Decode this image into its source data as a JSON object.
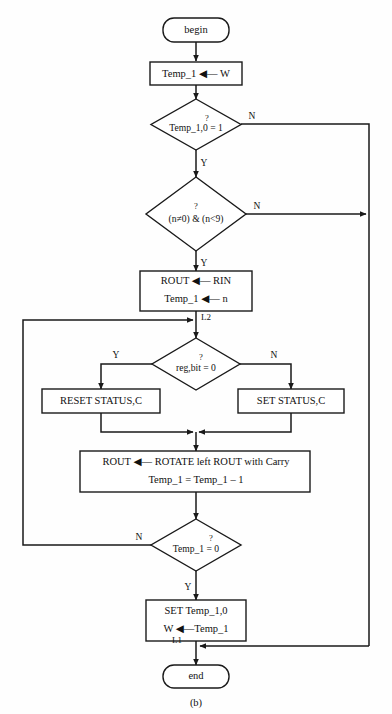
{
  "figure": {
    "caption": "(b)",
    "type": "flowchart",
    "stroke_color": "#1a1a1a",
    "fill_color": "#ffffff",
    "text_color": "#111111"
  },
  "nodes": {
    "begin": {
      "label": "begin",
      "shape": "terminator"
    },
    "load_temp": {
      "line1": "Temp_1 ◀— W",
      "shape": "process"
    },
    "decide_bit0": {
      "question_mark": "?",
      "label": "Temp_1,0 = 1",
      "shape": "decision"
    },
    "decide_range": {
      "question_mark": "?",
      "label": "(n≠0) & (n<9)",
      "shape": "decision"
    },
    "init_rout": {
      "line1": "ROUT ◀— RIN",
      "line2": "Temp_1 ◀— n",
      "shape": "process"
    },
    "decide_regbit": {
      "question_mark": "?",
      "label": "reg,bit = 0",
      "shape": "decision"
    },
    "reset_status": {
      "label": "RESET  STATUS,C",
      "shape": "process"
    },
    "set_status": {
      "label": "SET STATUS,C",
      "shape": "process"
    },
    "rotate": {
      "line1": "ROUT  ◀—   ROTATE left ROUT with Carry",
      "line2": "Temp_1 = Temp_1 – 1",
      "shape": "process"
    },
    "decide_temp_zero": {
      "question_mark": "?",
      "label": "Temp_1 = 0",
      "shape": "decision"
    },
    "finish_set": {
      "line1": "SET  Temp_1,0",
      "line2": "W ◀—Temp_1",
      "shape": "process"
    },
    "end": {
      "label": "end",
      "shape": "terminator"
    }
  },
  "branch_labels": {
    "bit0_no": "N",
    "bit0_yes": "Y",
    "range_no": "N",
    "range_yes": "Y",
    "regbit_yes": "Y",
    "regbit_no": "N",
    "temp_zero_no": "N",
    "temp_zero_yes": "Y"
  },
  "junctions": {
    "loop_top": "L2",
    "exit_join": "L1"
  }
}
